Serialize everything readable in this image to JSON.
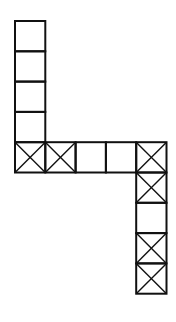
{
  "figure": {
    "stroke_color": "#111111",
    "background_color": "#ffffff",
    "grid_unit_note": "cells addressed by column/row index on a unit grid",
    "cells": [
      {
        "col": 0,
        "row": 0,
        "crossed": false
      },
      {
        "col": 0,
        "row": 1,
        "crossed": false
      },
      {
        "col": 0,
        "row": 2,
        "crossed": false
      },
      {
        "col": 0,
        "row": 3,
        "crossed": false
      },
      {
        "col": 0,
        "row": 4,
        "crossed": true
      },
      {
        "col": 1,
        "row": 4,
        "crossed": true
      },
      {
        "col": 2,
        "row": 4,
        "crossed": false
      },
      {
        "col": 3,
        "row": 4,
        "crossed": false
      },
      {
        "col": 4,
        "row": 4,
        "crossed": true
      },
      {
        "col": 4,
        "row": 5,
        "crossed": true
      },
      {
        "col": 4,
        "row": 6,
        "crossed": false
      },
      {
        "col": 4,
        "row": 7,
        "crossed": true
      },
      {
        "col": 4,
        "row": 8,
        "crossed": true
      }
    ]
  }
}
